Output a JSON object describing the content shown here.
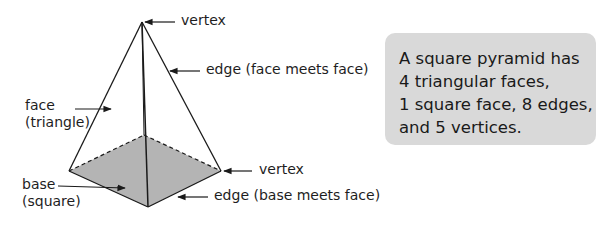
{
  "diagram": {
    "labels": {
      "apex_vertex": "vertex",
      "lateral_edge": "edge (face meets face)",
      "face_line1": "face",
      "face_line2": "(triangle)",
      "base_vertex": "vertex",
      "base_line1": "base",
      "base_line2": "(square)",
      "base_edge": "edge (base meets face)"
    },
    "colors": {
      "base_fill": "#b4b4b4",
      "line": "#1a1a1a",
      "box_fill": "#d9d9d9"
    }
  },
  "info_box": {
    "lines": [
      "A square pyramid has",
      "4 triangular faces,",
      "1 square face, 8 edges,",
      "and 5 vertices."
    ]
  }
}
